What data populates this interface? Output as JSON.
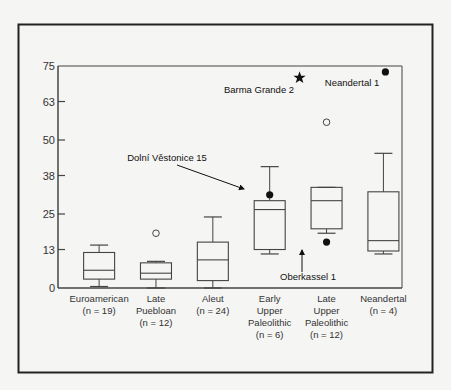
{
  "chart_data": {
    "type": "box",
    "title": "",
    "xlabel": "",
    "ylabel": "",
    "ylim": [
      0,
      75
    ],
    "yticks": [
      0,
      13,
      25,
      38,
      50,
      63,
      75
    ],
    "grid": false,
    "legend": null,
    "categories": [
      {
        "name": "Euroamerican",
        "lines": [
          "Euroamerican",
          "(n = 19)"
        ],
        "n": 19,
        "whisker_low": 0.5,
        "q1": 3,
        "median": 6,
        "q3": 12,
        "whisker_high": 14.5,
        "outliers": []
      },
      {
        "name": "Late Puebloan",
        "lines": [
          "Late",
          "Puebloan",
          "(n = 12)"
        ],
        "n": 12,
        "whisker_low": 0,
        "q1": 3,
        "median": 5,
        "q3": 8.5,
        "whisker_high": 9,
        "outliers": [
          {
            "value": 18.5,
            "style": "open"
          }
        ]
      },
      {
        "name": "Aleut",
        "lines": [
          "Aleut",
          "(n = 24)"
        ],
        "n": 24,
        "whisker_low": 0,
        "q1": 2.5,
        "median": 9.5,
        "q3": 15.5,
        "whisker_high": 24,
        "outliers": []
      },
      {
        "name": "Early Upper Paleolithic",
        "lines": [
          "Early",
          "Upper",
          "Paleolithic",
          "(n = 6)"
        ],
        "n": 6,
        "whisker_low": 11.5,
        "q1": 13,
        "median": 26.5,
        "q3": 29.5,
        "whisker_high": 41,
        "outliers": [
          {
            "value": 31.5,
            "style": "filled",
            "label": "Dolní Věstonice 15"
          }
        ]
      },
      {
        "name": "Late Upper Paleolithic",
        "lines": [
          "Late",
          "Upper",
          "Paleolithic",
          "(n = 12)"
        ],
        "n": 12,
        "whisker_low": 18.5,
        "q1": 20,
        "median": 29.5,
        "q3": 34,
        "whisker_high": 34,
        "outliers": [
          {
            "value": 56,
            "style": "open"
          },
          {
            "value": 15.5,
            "style": "filled",
            "label": "Oberkassel 1"
          },
          {
            "value": 71,
            "style": "star",
            "label": "Barma Grande 2"
          }
        ]
      },
      {
        "name": "Neandertal",
        "lines": [
          "Neandertal",
          "(n = 4)"
        ],
        "n": 4,
        "whisker_low": 11.5,
        "q1": 12.5,
        "median": 16,
        "q3": 32.5,
        "whisker_high": 45.5,
        "outliers": [
          {
            "value": 73,
            "style": "filled",
            "label": "Neandertal 1"
          }
        ]
      }
    ],
    "annotations": [
      {
        "text": "Barma Grande 2",
        "marker": "star",
        "value": 71
      },
      {
        "text": "Neandertal 1",
        "marker": "filled-circle",
        "value": 73
      },
      {
        "text": "Dolní Věstonice 15",
        "marker": "arrow",
        "value": 31.5
      },
      {
        "text": "Oberkassel 1",
        "marker": "arrow",
        "value": 15.5
      }
    ]
  },
  "labels": {
    "barma": "Barma Grande 2",
    "neandertal1": "Neandertal 1",
    "dolni": "Dolní Věstonice 15",
    "oberkassel": "Oberkassel 1"
  },
  "colors": {
    "line": "#444444",
    "frame": "#222222",
    "marker": "#111111",
    "background": "#f5f5f3"
  }
}
